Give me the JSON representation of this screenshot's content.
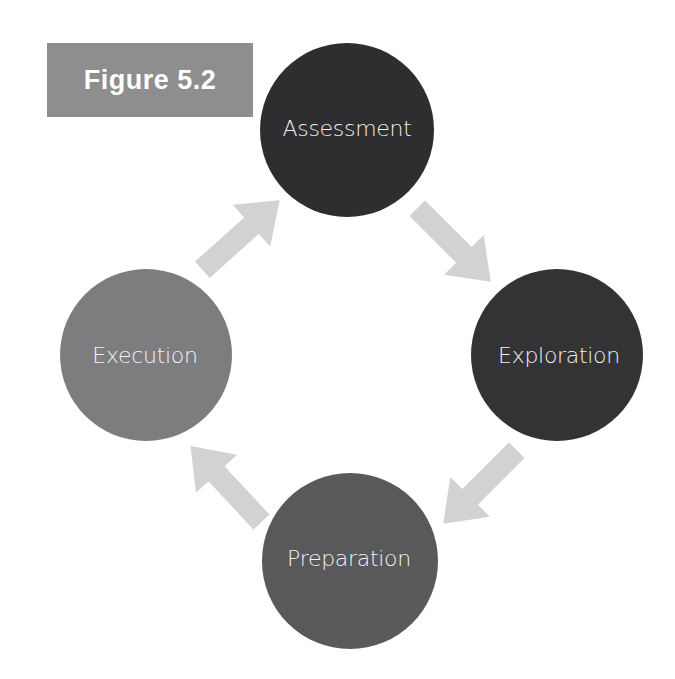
{
  "figure_label": "Figure 5.2",
  "colors": {
    "label_bg": "#8e8e8e",
    "arrow": "#d2d2d2",
    "assessment": "#2e2d2f",
    "exploration": "#333234",
    "preparation": "#59585a",
    "execution": "#7d7c7e",
    "node_text": "#f2f2f2"
  },
  "nodes": [
    {
      "id": "assessment",
      "label": "Assessment",
      "cx": 347,
      "cy": 130,
      "r": 87
    },
    {
      "id": "exploration",
      "label": "Exploration",
      "cx": 557,
      "cy": 355,
      "r": 86
    },
    {
      "id": "preparation",
      "label": "Preparation",
      "cx": 350,
      "cy": 561,
      "r": 88
    },
    {
      "id": "execution",
      "label": "Execution",
      "cx": 146,
      "cy": 355,
      "r": 86
    }
  ],
  "edges": [
    {
      "from": "assessment",
      "to": "exploration",
      "direction": "down-right"
    },
    {
      "from": "exploration",
      "to": "preparation",
      "direction": "down-left"
    },
    {
      "from": "preparation",
      "to": "execution",
      "direction": "up-left"
    },
    {
      "from": "execution",
      "to": "assessment",
      "direction": "up-right"
    }
  ]
}
